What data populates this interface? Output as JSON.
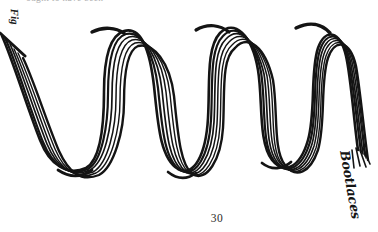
{
  "page": {
    "width": 378,
    "height": 232,
    "background_color": "#ffffff",
    "ink_color": "#141414",
    "folio": "30",
    "header_text": "ought to have been",
    "edge_fragment_text": "Fig."
  },
  "labels": {
    "subject": "Bootlaces",
    "subject_rotation_deg": 80
  },
  "illustration": {
    "name": "bootlaces-squiggle",
    "description": "Hand-drawn bundle of bootlaces laid out in a serpentine zig-zag of three peaks and three troughs, rendered as a cluster of parallel pen strokes.",
    "style": "pen-and-ink line drawing",
    "stroke_count": 6,
    "technique": "multiple parallel contour strokes forming a rope bundle",
    "start_cap": "blunt diagonal cut at left page edge",
    "end_cap": "frayed splayed ends at lower right",
    "peaks": [
      {
        "x": 100,
        "y": 31
      },
      {
        "x": 205,
        "y": 27
      },
      {
        "x": 307,
        "y": 25
      }
    ],
    "troughs": [
      {
        "x": 70,
        "y": 168
      },
      {
        "x": 178,
        "y": 172
      },
      {
        "x": 272,
        "y": 165
      }
    ],
    "left_end": {
      "x": 2,
      "y": 52
    },
    "right_end": {
      "x": 356,
      "y": 152
    }
  }
}
